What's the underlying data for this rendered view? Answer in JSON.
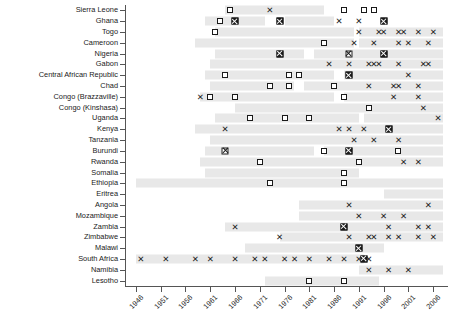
{
  "chart_data": {
    "type": "scatter",
    "title": "",
    "subtitle": "",
    "xlabel": "",
    "ylabel": "",
    "xlim": [
      1944,
      2009
    ],
    "grid": false,
    "legend_position": "none",
    "x_ticks": [
      "1946",
      "1951",
      "1956",
      "1961",
      "1966",
      "1971",
      "1976",
      "1981",
      "1986",
      "1991",
      "1996",
      "2001",
      "2006"
    ],
    "x_tick_values": [
      1946,
      1951,
      1956,
      1961,
      1966,
      1971,
      1976,
      1981,
      1986,
      1991,
      1996,
      2001,
      2006
    ],
    "marker_types": {
      "square": "open-square",
      "x": "cross",
      "both": "filled-square-with-cross",
      "xsq": "cross-over-open-square"
    },
    "categories": [
      "Sierra Leone",
      "Ghana",
      "Togo",
      "Cameroon",
      "Nigeria",
      "Gabon",
      "Central African Republic",
      "Chad",
      "Congo (Brazzaville)",
      "Congo (Kinshasa)",
      "Uganda",
      "Kenya",
      "Tanzania",
      "Burundi",
      "Rwanda",
      "Somalia",
      "Ethiopia",
      "Eritrea",
      "Angola",
      "Mozambique",
      "Zambia",
      "Zimbabwe",
      "Malawi",
      "South Africa",
      "Namibia",
      "Lesotho"
    ],
    "series": [
      {
        "name": "Sierra Leone",
        "bands": [
          [
            1964,
            1984
          ]
        ],
        "points": [
          {
            "year": 1965,
            "type": "square"
          },
          {
            "year": 1973,
            "type": "x"
          },
          {
            "year": 1988,
            "type": "square"
          },
          {
            "year": 1992,
            "type": "square"
          },
          {
            "year": 1994,
            "type": "square"
          }
        ]
      },
      {
        "name": "Ghana",
        "bands": [
          [
            1960,
            1972
          ],
          [
            1976,
            1986
          ]
        ],
        "points": [
          {
            "year": 1963,
            "type": "square"
          },
          {
            "year": 1966,
            "type": "both"
          },
          {
            "year": 1975,
            "type": "both"
          },
          {
            "year": 1987,
            "type": "x"
          },
          {
            "year": 1991,
            "type": "x"
          },
          {
            "year": 1996,
            "type": "both"
          }
        ]
      },
      {
        "name": "Togo",
        "bands": [
          [
            1962,
            1990
          ],
          [
            1991,
            2008
          ]
        ],
        "points": [
          {
            "year": 1962,
            "type": "square"
          },
          {
            "year": 1991,
            "type": "x"
          },
          {
            "year": 1995,
            "type": "x"
          },
          {
            "year": 1996,
            "type": "x"
          },
          {
            "year": 1999,
            "type": "x"
          },
          {
            "year": 2000,
            "type": "x"
          },
          {
            "year": 2003,
            "type": "x"
          },
          {
            "year": 2006,
            "type": "x"
          }
        ]
      },
      {
        "name": "Cameroon",
        "bands": [
          [
            1958,
            1990
          ],
          [
            1991,
            2008
          ]
        ],
        "points": [
          {
            "year": 1984,
            "type": "square"
          },
          {
            "year": 1990,
            "type": "x"
          },
          {
            "year": 1994,
            "type": "x"
          },
          {
            "year": 1999,
            "type": "x"
          },
          {
            "year": 2001,
            "type": "x"
          },
          {
            "year": 2005,
            "type": "x"
          }
        ]
      },
      {
        "name": "Nigeria",
        "bands": [
          [
            1962,
            1980
          ],
          [
            1982,
            2008
          ]
        ],
        "points": [
          {
            "year": 1975,
            "type": "both"
          },
          {
            "year": 1989,
            "type": "xsq"
          },
          {
            "year": 1996,
            "type": "both"
          }
        ]
      },
      {
        "name": "Gabon",
        "bands": [
          [
            1961,
            2008
          ]
        ],
        "points": [
          {
            "year": 1985,
            "type": "x"
          },
          {
            "year": 1989,
            "type": "x"
          },
          {
            "year": 1993,
            "type": "x"
          },
          {
            "year": 1994,
            "type": "x"
          },
          {
            "year": 1995,
            "type": "x"
          },
          {
            "year": 1999,
            "type": "x"
          },
          {
            "year": 2004,
            "type": "x"
          },
          {
            "year": 2005,
            "type": "x"
          }
        ]
      },
      {
        "name": "Central African Republic",
        "bands": [
          [
            1960,
            1986
          ],
          [
            1988,
            2008
          ]
        ],
        "points": [
          {
            "year": 1964,
            "type": "square"
          },
          {
            "year": 1977,
            "type": "square"
          },
          {
            "year": 1979,
            "type": "square"
          },
          {
            "year": 1989,
            "type": "both"
          },
          {
            "year": 2001,
            "type": "x"
          }
        ]
      },
      {
        "name": "Chad",
        "bands": [
          [
            1961,
            1978
          ],
          [
            1980,
            2008
          ]
        ],
        "points": [
          {
            "year": 1973,
            "type": "square"
          },
          {
            "year": 1977,
            "type": "square"
          },
          {
            "year": 1986,
            "type": "square"
          },
          {
            "year": 1993,
            "type": "x"
          },
          {
            "year": 1998,
            "type": "x"
          },
          {
            "year": 1999,
            "type": "x"
          },
          {
            "year": 2003,
            "type": "x"
          }
        ]
      },
      {
        "name": "Congo (Brazzaville)",
        "bands": [
          [
            1959,
            1986
          ],
          [
            1988,
            2008
          ]
        ],
        "points": [
          {
            "year": 1959,
            "type": "x"
          },
          {
            "year": 1961,
            "type": "square"
          },
          {
            "year": 1966,
            "type": "square"
          },
          {
            "year": 1988,
            "type": "square"
          },
          {
            "year": 1998,
            "type": "x"
          },
          {
            "year": 2003,
            "type": "x"
          }
        ]
      },
      {
        "name": "Congo (Kinshasa)",
        "bands": [
          [
            1966,
            2008
          ]
        ],
        "points": [
          {
            "year": 1993,
            "type": "square"
          },
          {
            "year": 2004,
            "type": "x"
          }
        ]
      },
      {
        "name": "Uganda",
        "bands": [
          [
            1962,
            1991
          ],
          [
            1992,
            2008
          ]
        ],
        "points": [
          {
            "year": 1969,
            "type": "square"
          },
          {
            "year": 1976,
            "type": "square"
          },
          {
            "year": 1981,
            "type": "square"
          },
          {
            "year": 2007,
            "type": "x"
          }
        ]
      },
      {
        "name": "Kenya",
        "bands": [
          [
            1958,
            2008
          ]
        ],
        "points": [
          {
            "year": 1964,
            "type": "x"
          },
          {
            "year": 1987,
            "type": "x"
          },
          {
            "year": 1989,
            "type": "x"
          },
          {
            "year": 1992,
            "type": "x"
          },
          {
            "year": 1997,
            "type": "both"
          }
        ]
      },
      {
        "name": "Tanzania",
        "bands": [
          [
            1961,
            2008
          ]
        ],
        "points": [
          {
            "year": 1990,
            "type": "x"
          },
          {
            "year": 1994,
            "type": "x"
          },
          {
            "year": 1999,
            "type": "x"
          }
        ]
      },
      {
        "name": "Burundi",
        "bands": [
          [
            1960,
            1982
          ],
          [
            1984,
            2008
          ]
        ],
        "points": [
          {
            "year": 1964,
            "type": "xsq"
          },
          {
            "year": 1984,
            "type": "square"
          },
          {
            "year": 1989,
            "type": "both"
          },
          {
            "year": 1999,
            "type": "square"
          }
        ]
      },
      {
        "name": "Rwanda",
        "bands": [
          [
            1959,
            2008
          ]
        ],
        "points": [
          {
            "year": 1971,
            "type": "square"
          },
          {
            "year": 1991,
            "type": "square"
          },
          {
            "year": 2000,
            "type": "x"
          },
          {
            "year": 2003,
            "type": "x"
          }
        ]
      },
      {
        "name": "Somalia",
        "bands": [
          [
            1960,
            1991
          ]
        ],
        "points": [
          {
            "year": 1988,
            "type": "square"
          }
        ]
      },
      {
        "name": "Ethiopia",
        "bands": [
          [
            1946,
            2008
          ]
        ],
        "points": [
          {
            "year": 1973,
            "type": "square"
          },
          {
            "year": 1988,
            "type": "square"
          }
        ]
      },
      {
        "name": "Eritrea",
        "bands": [
          [
            1996,
            2008
          ]
        ],
        "points": []
      },
      {
        "name": "Angola",
        "bands": [
          [
            1979,
            2008
          ]
        ],
        "points": [
          {
            "year": 1989,
            "type": "x"
          },
          {
            "year": 2005,
            "type": "x"
          }
        ]
      },
      {
        "name": "Mozambique",
        "bands": [
          [
            1979,
            2008
          ]
        ],
        "points": [
          {
            "year": 1991,
            "type": "x"
          },
          {
            "year": 1996,
            "type": "x"
          },
          {
            "year": 2000,
            "type": "x"
          }
        ]
      },
      {
        "name": "Zambia",
        "bands": [
          [
            1964,
            2008
          ]
        ],
        "points": [
          {
            "year": 1966,
            "type": "x"
          },
          {
            "year": 1988,
            "type": "both"
          },
          {
            "year": 1997,
            "type": "x"
          },
          {
            "year": 2003,
            "type": "x"
          },
          {
            "year": 2005,
            "type": "x"
          }
        ]
      },
      {
        "name": "Zimbabwe",
        "bands": [
          [
            1975,
            2008
          ]
        ],
        "points": [
          {
            "year": 1975,
            "type": "x"
          },
          {
            "year": 1989,
            "type": "x"
          },
          {
            "year": 1993,
            "type": "x"
          },
          {
            "year": 1994,
            "type": "x"
          },
          {
            "year": 1997,
            "type": "x"
          },
          {
            "year": 1999,
            "type": "x"
          },
          {
            "year": 2003,
            "type": "x"
          },
          {
            "year": 2006,
            "type": "x"
          }
        ]
      },
      {
        "name": "Malawi",
        "bands": [
          [
            1968,
            1996
          ]
        ],
        "points": [
          {
            "year": 1991,
            "type": "both"
          }
        ]
      },
      {
        "name": "South Africa",
        "bands": [
          [
            1946,
            1992
          ]
        ],
        "points": [
          {
            "year": 1947,
            "type": "x"
          },
          {
            "year": 1952,
            "type": "x"
          },
          {
            "year": 1958,
            "type": "x"
          },
          {
            "year": 1961,
            "type": "x"
          },
          {
            "year": 1966,
            "type": "x"
          },
          {
            "year": 1970,
            "type": "x"
          },
          {
            "year": 1972,
            "type": "x"
          },
          {
            "year": 1976,
            "type": "x"
          },
          {
            "year": 1978,
            "type": "x"
          },
          {
            "year": 1981,
            "type": "x"
          },
          {
            "year": 1985,
            "type": "x"
          },
          {
            "year": 1988,
            "type": "x"
          },
          {
            "year": 1991,
            "type": "x"
          },
          {
            "year": 1993,
            "type": "x"
          },
          {
            "year": 1992,
            "type": "both"
          }
        ]
      },
      {
        "name": "Namibia",
        "bands": [
          [
            1991,
            2008
          ]
        ],
        "points": [
          {
            "year": 1993,
            "type": "x"
          },
          {
            "year": 1997,
            "type": "x"
          },
          {
            "year": 2001,
            "type": "x"
          }
        ]
      },
      {
        "name": "Lesotho",
        "bands": [
          [
            1972,
            1995
          ]
        ],
        "points": [
          {
            "year": 1981,
            "type": "square"
          },
          {
            "year": 1988,
            "type": "square"
          }
        ]
      }
    ]
  }
}
